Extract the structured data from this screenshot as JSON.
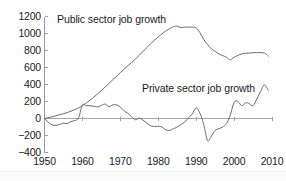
{
  "chart_data": {
    "type": "line",
    "title": "",
    "xlabel": "",
    "ylabel": "",
    "xlim": [
      1950,
      2010
    ],
    "ylim": [
      -400,
      1200
    ],
    "grid": false,
    "legend": "inline-annotations",
    "y_ticks": [
      1200,
      1000,
      800,
      600,
      400,
      200,
      0,
      -200,
      -400
    ],
    "y_tick_labels": [
      "1200",
      "1000",
      "800",
      "600",
      "400",
      "200",
      "0",
      "−200",
      "−400"
    ],
    "x_ticks": [
      1950,
      1960,
      1970,
      1980,
      1990,
      2000,
      2010
    ],
    "x_tick_labels": [
      "1950",
      "1960",
      "1970",
      "1980",
      "1990",
      "2000",
      "2010"
    ],
    "series": [
      {
        "name": "Public sector job growth",
        "color": "#6b6b6b",
        "label_text": "Public sector job growth",
        "x": [
          1950,
          1952,
          1954,
          1956,
          1958,
          1960,
          1962,
          1964,
          1966,
          1968,
          1970,
          1972,
          1974,
          1976,
          1978,
          1980,
          1982,
          1984,
          1985,
          1986,
          1987,
          1988,
          1989,
          1990,
          1991,
          1992,
          1993,
          1994,
          1995,
          1996,
          1997,
          1998,
          1999,
          2000,
          2002,
          2004,
          2006,
          2008,
          2009
        ],
        "values": [
          0,
          20,
          45,
          70,
          105,
          150,
          215,
          290,
          370,
          455,
          540,
          620,
          700,
          790,
          880,
          960,
          1030,
          1080,
          1085,
          1070,
          1075,
          1075,
          1075,
          1065,
          1010,
          930,
          870,
          820,
          790,
          760,
          740,
          720,
          690,
          720,
          760,
          770,
          775,
          770,
          735
        ]
      },
      {
        "name": "Private sector job growth",
        "color": "#6b6b6b",
        "label_text": "Private sector job growth",
        "x": [
          1950,
          1951,
          1952,
          1953,
          1954,
          1955,
          1956,
          1957,
          1958,
          1959,
          1960,
          1961,
          1962,
          1963,
          1964,
          1965,
          1966,
          1967,
          1968,
          1969,
          1970,
          1971,
          1972,
          1973,
          1974,
          1975,
          1976,
          1977,
          1978,
          1979,
          1980,
          1981,
          1982,
          1983,
          1984,
          1985,
          1986,
          1987,
          1988,
          1989,
          1990,
          1991,
          1992,
          1993,
          1994,
          1995,
          1996,
          1997,
          1998,
          1999,
          2000,
          2001,
          2002,
          2003,
          2004,
          2005,
          2006,
          2007,
          2008,
          2009
        ],
        "values": [
          0,
          -45,
          -75,
          -80,
          -70,
          -55,
          -60,
          -35,
          -25,
          10,
          160,
          150,
          150,
          145,
          135,
          155,
          170,
          140,
          160,
          160,
          135,
          90,
          60,
          20,
          -15,
          5,
          -20,
          -55,
          -85,
          -95,
          -90,
          -100,
          -135,
          -140,
          -120,
          -100,
          -70,
          -40,
          10,
          55,
          125,
          60,
          -70,
          -260,
          -210,
          -140,
          -120,
          -100,
          -60,
          40,
          190,
          200,
          150,
          185,
          175,
          150,
          230,
          320,
          395,
          330
        ]
      }
    ]
  },
  "axis": {
    "y_axis_name": "y-axis",
    "x_axis_name": "x-axis",
    "zero_line_name": "zero-reference-line"
  }
}
